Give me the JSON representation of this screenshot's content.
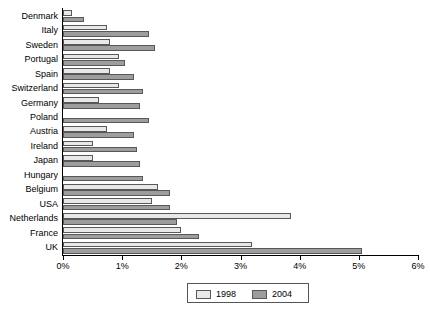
{
  "chart_data": {
    "type": "bar",
    "orientation": "horizontal",
    "title": "",
    "xlabel": "",
    "ylabel": "",
    "xlim": [
      0,
      6
    ],
    "xticks": [
      "0%",
      "1%",
      "2%",
      "3%",
      "4%",
      "5%",
      "6%"
    ],
    "xtick_values": [
      0,
      1,
      2,
      3,
      4,
      5,
      6
    ],
    "grid": false,
    "legend_position": "bottom-center",
    "categories": [
      "Denmark",
      "Italy",
      "Sweden",
      "Portugal",
      "Spain",
      "Switzerland",
      "Germany",
      "Poland",
      "Austria",
      "Ireland",
      "Japan",
      "Hungary",
      "Belgium",
      "USA",
      "Netherlands",
      "France",
      "UK"
    ],
    "series": [
      {
        "name": "1998",
        "color": "#e8e8e8",
        "values": [
          0.15,
          0.75,
          0.8,
          0.95,
          0.8,
          0.95,
          0.6,
          0.0,
          0.75,
          0.5,
          0.5,
          0.0,
          1.6,
          1.5,
          3.85,
          2.0,
          3.2
        ]
      },
      {
        "name": "2004",
        "color": "#9d9d9d",
        "values": [
          0.35,
          1.45,
          1.55,
          1.05,
          1.2,
          1.35,
          1.3,
          1.45,
          1.2,
          1.25,
          1.3,
          1.35,
          1.8,
          1.8,
          1.92,
          2.3,
          5.05
        ]
      }
    ]
  },
  "legend": {
    "entries": [
      {
        "label": "1998"
      },
      {
        "label": "2004"
      }
    ]
  }
}
